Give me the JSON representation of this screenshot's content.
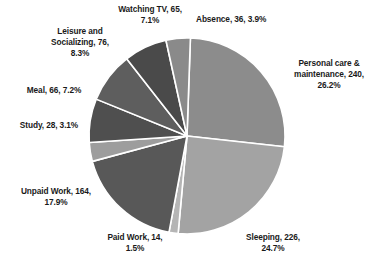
{
  "chart_data": {
    "type": "pie",
    "title": "",
    "xlabel": "",
    "ylabel": "",
    "legend_position": "none",
    "grid": false,
    "labels_show_value_and_percent": true,
    "total": 915,
    "categories": [
      "Personal care & maintenance",
      "Sleeping",
      "Paid Work",
      "Unpaid Work",
      "Study",
      "Meal",
      "Leisure and Socializing",
      "Watching TV",
      "Absence"
    ],
    "values": [
      240,
      226,
      14,
      164,
      28,
      66,
      76,
      65,
      36
    ],
    "percents": [
      26.2,
      24.7,
      1.5,
      17.9,
      3.1,
      7.2,
      8.3,
      7.1,
      3.9
    ],
    "colors": [
      "#8c8c8c",
      "#a3a3a3",
      "#b5b5b5",
      "#585858",
      "#9d9d9d",
      "#4f4f4f",
      "#5e5e5e",
      "#4a4a4a",
      "#8a8a8a"
    ],
    "slices": [
      {
        "name": "personal-care",
        "label": "Personal care &\nmaintenance, 240,\n26.2%",
        "category": "Personal care & maintenance",
        "value": 240,
        "percent": 26.2,
        "color": "#8c8c8c",
        "start_angle": 2.0,
        "end_angle": 96.3
      },
      {
        "name": "sleeping",
        "label": "Sleeping, 226,\n24.7%",
        "category": "Sleeping",
        "value": 226,
        "percent": 24.7,
        "color": "#a3a3a3",
        "start_angle": 96.3,
        "end_angle": 185.2
      },
      {
        "name": "paid-work",
        "label": "Paid Work, 14,\n1.5%",
        "category": "Paid Work",
        "value": 14,
        "percent": 1.5,
        "color": "#b5b5b5",
        "start_angle": 185.2,
        "end_angle": 190.6
      },
      {
        "name": "unpaid-work",
        "label": "Unpaid Work, 164,\n17.9%",
        "category": "Unpaid Work",
        "value": 164,
        "percent": 17.9,
        "color": "#585858",
        "start_angle": 190.6,
        "end_angle": 255.0
      },
      {
        "name": "study",
        "label": "Study, 28, 3.1%",
        "category": "Study",
        "value": 28,
        "percent": 3.1,
        "color": "#9d9d9d",
        "start_angle": 255.0,
        "end_angle": 266.2
      },
      {
        "name": "meal",
        "label": "Meal, 66, 7.2%",
        "category": "Meal",
        "value": 66,
        "percent": 7.2,
        "color": "#4f4f4f",
        "start_angle": 266.2,
        "end_angle": 292.1
      },
      {
        "name": "leisure-socializing",
        "label": "Leisure and\nSocializing, 76,\n8.3%",
        "category": "Leisure and Socializing",
        "value": 76,
        "percent": 8.3,
        "color": "#5e5e5e",
        "start_angle": 292.1,
        "end_angle": 322.0
      },
      {
        "name": "watching-tv",
        "label": "Watching TV, 65,\n7.1%",
        "category": "Watching TV",
        "value": 65,
        "percent": 7.1,
        "color": "#4a4a4a",
        "start_angle": 322.0,
        "end_angle": 347.6
      },
      {
        "name": "absence",
        "label": "Absence, 36, 3.9%",
        "category": "Absence",
        "value": 36,
        "percent": 3.9,
        "color": "#8a8a8a",
        "start_angle": 347.6,
        "end_angle": 362.0
      }
    ],
    "geometry": {
      "center_x": 187,
      "center_y": 136,
      "radius": 98,
      "separator_color": "#ffffff",
      "separator_width": 1.6
    }
  }
}
